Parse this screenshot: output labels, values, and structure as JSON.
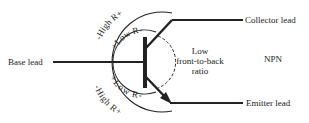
{
  "diagram": {
    "type": "NPN",
    "labels": {
      "base": "Base lead",
      "collector": "Collector lead",
      "emitter": "Emitter lead",
      "npn": "NPN",
      "ratio_line1": "Low",
      "ratio_line2": "front-to-back",
      "ratio_line3": "ratio",
      "high_top": "-High R+",
      "low_top": "+Low R-",
      "low_bottom": "+Low R-",
      "high_bottom": "-High R+"
    },
    "colors": {
      "ink": "#222222",
      "background": "#ffffff"
    }
  }
}
